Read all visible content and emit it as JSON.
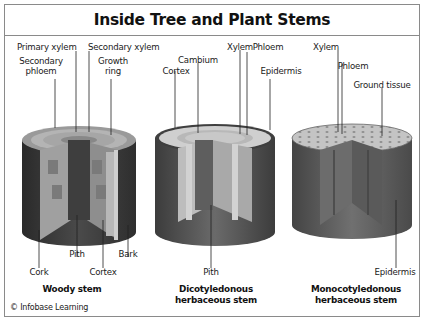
{
  "title": "Inside Tree and Plant Stems",
  "credit": "© Infobase Learning",
  "colors": {
    "border": "#8a8a8a",
    "bark_dark": "#3a3a3a",
    "cortex_light": "#a8a8a8",
    "top_face": "#c8c8c8",
    "pith_dark": "#4a4a4a",
    "ground_tissue": "#bdbdbd"
  },
  "diagrams": [
    {
      "id": "woody",
      "caption": "Woody stem",
      "labels_top": [
        "Primary xylem",
        "Secondary xylem",
        "Secondary phloem",
        "Growth ring"
      ],
      "labels_bottom": [
        "Pith",
        "Bark",
        "Cork",
        "Cortex"
      ]
    },
    {
      "id": "dicot",
      "caption_line1": "Dicotyledonous",
      "caption_line2": "herbaceous stem",
      "labels_top": [
        "Xylem",
        "Phloem",
        "Cambium",
        "Cortex",
        "Epidermis"
      ],
      "labels_bottom": [
        "Pith"
      ]
    },
    {
      "id": "monocot",
      "caption_line1": "Monocotyledonous",
      "caption_line2": "herbaceous stem",
      "labels_top": [
        "Xylem",
        "Phloem",
        "Ground tissue"
      ],
      "labels_bottom": [
        "Epidermis"
      ]
    }
  ]
}
